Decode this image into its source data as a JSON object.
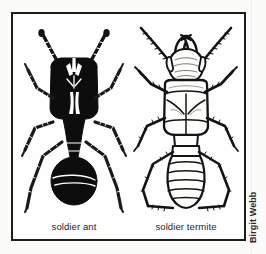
{
  "figure": {
    "panels": [
      {
        "id": "soldier-ant",
        "caption": "soldier ant",
        "style": "solid-black-silhouette",
        "subject": "ant"
      },
      {
        "id": "soldier-termite",
        "caption": "soldier termite",
        "style": "line-art-outline",
        "subject": "termite"
      }
    ],
    "credit": "Birgit Webb",
    "colors": {
      "ink": "#111111",
      "frame": "#1c1c1c",
      "paper": "#ffffff",
      "scan_background": "#fbfbfa",
      "caption_text": "#262626",
      "credit_text": "#2a2a2a"
    }
  }
}
